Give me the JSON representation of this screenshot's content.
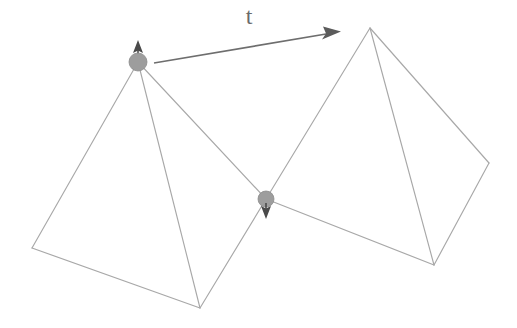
{
  "figure": {
    "background_color": "#ffffff",
    "edge_color": "#a8a8a8",
    "node_color": "#9d9d9d",
    "vector_color": "#5b5b5b",
    "label_color": "#6a6a6a"
  },
  "labels": {
    "translation_vector": "t"
  },
  "vertices": {
    "left_apex": {
      "name": "left-apex-node",
      "x": 138,
      "y": 62
    },
    "left_far_corner": {
      "name": "left-far-corner",
      "x": 32,
      "y": 248
    },
    "left_bottom_corner": {
      "name": "left-bottom-corner",
      "x": 200,
      "y": 308
    },
    "shared_node": {
      "name": "shared-node",
      "x": 266,
      "y": 199
    },
    "right_apex": {
      "name": "right-apex",
      "x": 370,
      "y": 28
    },
    "right_far_corner": {
      "name": "right-far-corner",
      "x": 489,
      "y": 163
    },
    "right_bottom_corner": {
      "name": "right-bottom-corner",
      "x": 434,
      "y": 265
    }
  },
  "nodes": [
    {
      "id": "left-apex-node",
      "cx": 138,
      "cy": 62,
      "r": 9,
      "arrow": "up"
    },
    {
      "id": "shared-node",
      "cx": 266,
      "cy": 199,
      "r": 8,
      "arrow": "down"
    }
  ],
  "translation_arrow": {
    "start_x": 154,
    "start_y": 63,
    "end_x": 340,
    "end_y": 32,
    "label": "t",
    "label_x": 249,
    "label_y": 18
  },
  "edges": [
    {
      "from": "left_apex",
      "to": "left_far_corner"
    },
    {
      "from": "left_apex",
      "to": "left_bottom_corner"
    },
    {
      "from": "left_apex",
      "to": "shared_node"
    },
    {
      "from": "left_far_corner",
      "to": "left_bottom_corner"
    },
    {
      "from": "left_bottom_corner",
      "to": "shared_node"
    },
    {
      "from": "right_apex",
      "to": "shared_node"
    },
    {
      "from": "right_apex",
      "to": "right_far_corner"
    },
    {
      "from": "right_apex",
      "to": "right_bottom_corner"
    },
    {
      "from": "shared_node",
      "to": "right_bottom_corner"
    },
    {
      "from": "right_far_corner",
      "to": "right_bottom_corner"
    }
  ]
}
